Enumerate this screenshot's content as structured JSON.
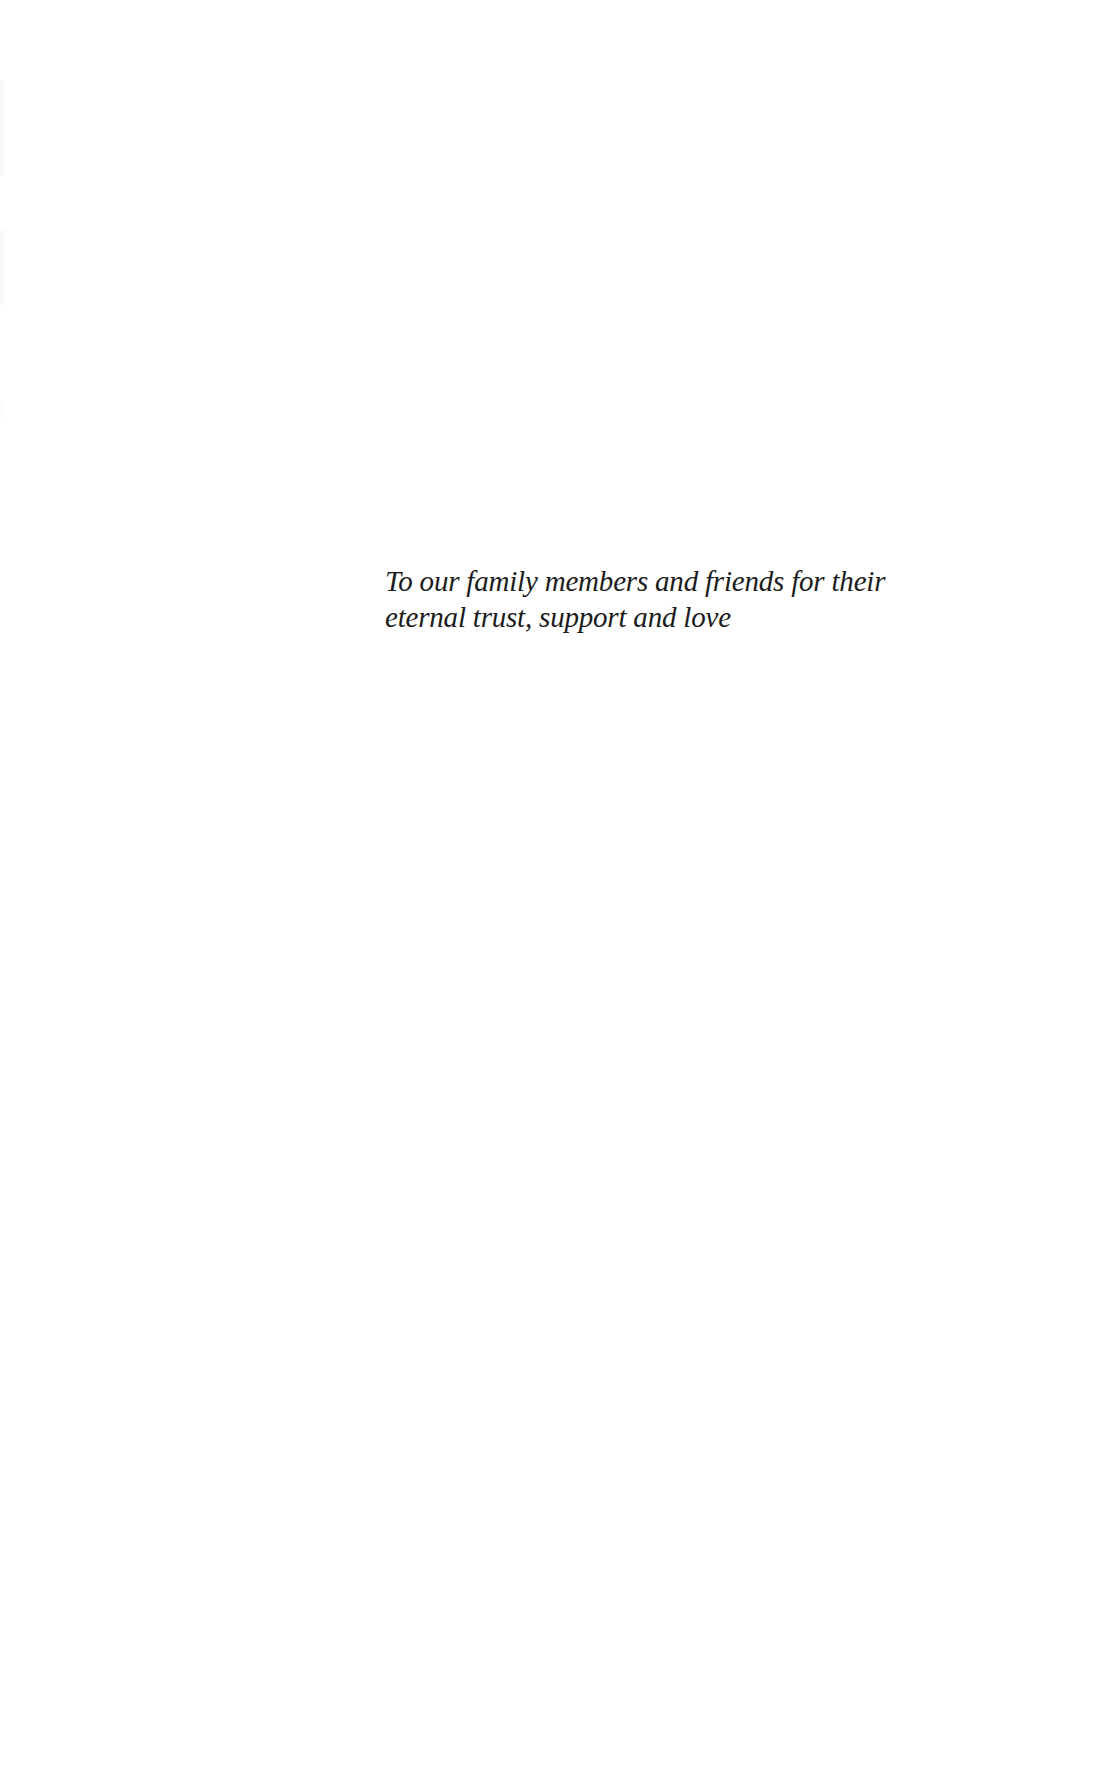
{
  "page": {
    "type": "dedication",
    "background": "#ffffff",
    "text_color": "#1c1c1c"
  },
  "dedication": {
    "lines": [
      "To our family members and friends for their",
      "eternal trust, support and love"
    ]
  }
}
